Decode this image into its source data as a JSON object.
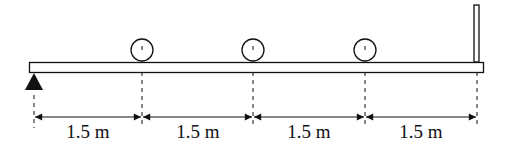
{
  "diagram": {
    "beam": {
      "x1": 29,
      "x2": 484,
      "top": 62,
      "bottom": 72
    },
    "support": "pin-support",
    "loads": [
      {
        "label": "load-1",
        "x": 142
      },
      {
        "label": "load-2",
        "x": 253
      },
      {
        "label": "load-3",
        "x": 365
      }
    ],
    "post": {
      "x": 474
    },
    "dimensions": [
      {
        "label": "1.5 m",
        "x1": 34,
        "x2": 142
      },
      {
        "label": "1.5 m",
        "x1": 142,
        "x2": 253
      },
      {
        "label": "1.5 m",
        "x1": 253,
        "x2": 365
      },
      {
        "label": "1.5 m",
        "x1": 365,
        "x2": 477
      }
    ]
  }
}
